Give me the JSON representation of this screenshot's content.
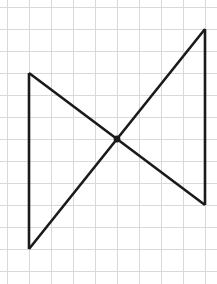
{
  "canvas": {
    "width": 217,
    "height": 284,
    "background_color": "#ffffff"
  },
  "grid": {
    "label": "graph-paper-grid",
    "cell_size": 22,
    "line_color": "#d9d9d9",
    "line_width": 1,
    "origin_x": 7,
    "origin_y": 7,
    "columns": 9,
    "rows": 12,
    "vertical_line_x": [
      7,
      29,
      51,
      73,
      95,
      117,
      139,
      161,
      183,
      205
    ],
    "horizontal_line_y": [
      7,
      29,
      51,
      73,
      95,
      117,
      139,
      161,
      183,
      205,
      227,
      249,
      271
    ]
  },
  "figure": {
    "name": "bowtie-figure",
    "stroke_color": "#1a1a1a",
    "stroke_width": 2.6,
    "segments": [
      {
        "name": "left-vertical-segment",
        "x1": 29,
        "y1": 73,
        "x2": 29,
        "y2": 249
      },
      {
        "name": "right-vertical-segment",
        "x1": 205,
        "y1": 29,
        "x2": 205,
        "y2": 205
      },
      {
        "name": "descending-diagonal-segment",
        "x1": 29,
        "y1": 73,
        "x2": 205,
        "y2": 205
      },
      {
        "name": "ascending-diagonal-segment",
        "x1": 29,
        "y1": 249,
        "x2": 205,
        "y2": 29
      }
    ],
    "vertices": [
      {
        "name": "top-left-vertex",
        "x": 29,
        "y": 73
      },
      {
        "name": "bottom-left-vertex",
        "x": 29,
        "y": 249
      },
      {
        "name": "top-right-vertex",
        "x": 205,
        "y": 29
      },
      {
        "name": "bottom-right-vertex",
        "x": 205,
        "y": 205
      }
    ],
    "intersection_point": {
      "name": "diagonal-intersection-point",
      "x": 117,
      "y": 139,
      "radius": 3.4,
      "color": "#1a1a1a"
    }
  }
}
